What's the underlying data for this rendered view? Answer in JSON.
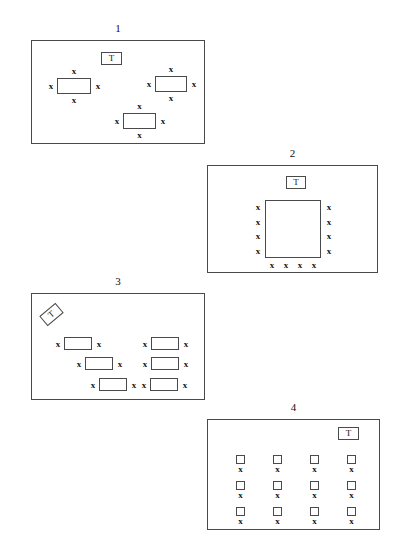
{
  "figure": {
    "background_color": "#ffffff",
    "line_color": "#4a4a4a",
    "text_color": "#111111",
    "mark_symbol": "x",
    "badge_symbol": "T",
    "width": 412,
    "height": 548
  },
  "panels": [
    {
      "label": "1",
      "x": 31,
      "y": 40,
      "w": 174,
      "h": 104,
      "badge": {
        "x": 101,
        "y": 52,
        "w": 21,
        "h": 13,
        "text": "T",
        "rotated": false
      },
      "nodes": [
        {
          "name": "node-1-left",
          "x": 57,
          "y": 78,
          "w": 34,
          "h": 16,
          "marks": [
            {
              "side": "top",
              "text": "x"
            },
            {
              "side": "left",
              "text": "x"
            },
            {
              "side": "right",
              "text": "x"
            },
            {
              "side": "bottom",
              "text": "x"
            }
          ]
        },
        {
          "name": "node-1-right",
          "x": 155,
          "y": 76,
          "w": 32,
          "h": 16,
          "marks": [
            {
              "side": "top",
              "text": "x"
            },
            {
              "side": "left",
              "text": "x"
            },
            {
              "side": "right",
              "text": "x"
            },
            {
              "side": "bottom",
              "text": "x"
            }
          ]
        },
        {
          "name": "node-1-bottom",
          "x": 123,
          "y": 113,
          "w": 33,
          "h": 16,
          "marks": [
            {
              "side": "top",
              "text": "x"
            },
            {
              "side": "left",
              "text": "x"
            },
            {
              "side": "right",
              "text": "x"
            },
            {
              "side": "bottom",
              "text": "x"
            }
          ]
        }
      ],
      "grid": null
    },
    {
      "label": "2",
      "x": 207,
      "y": 165,
      "w": 171,
      "h": 108,
      "badge": {
        "x": 286,
        "y": 176,
        "w": 20,
        "h": 13,
        "text": "T",
        "rotated": false
      },
      "nodes": [
        {
          "name": "node-2-center",
          "x": 265,
          "y": 200,
          "w": 56,
          "h": 58,
          "marks": [
            {
              "side": "left-stack",
              "text": "x",
              "count": 4
            },
            {
              "side": "right-stack",
              "text": "x",
              "count": 4
            },
            {
              "side": "bottom-row",
              "text": "x",
              "count": 4
            }
          ]
        }
      ],
      "grid": null
    },
    {
      "label": "3",
      "x": 31,
      "y": 293,
      "w": 174,
      "h": 107,
      "badge": {
        "x": 41,
        "y": 308,
        "w": 21,
        "h": 13,
        "text": "T",
        "rotated": true
      },
      "nodes": [
        {
          "name": "node-3-a",
          "x": 64,
          "y": 337,
          "w": 28,
          "h": 13,
          "marks": [
            {
              "side": "left",
              "text": "x"
            },
            {
              "side": "right",
              "text": "x"
            }
          ]
        },
        {
          "name": "node-3-b",
          "x": 151,
          "y": 337,
          "w": 28,
          "h": 13,
          "marks": [
            {
              "side": "left",
              "text": "x"
            },
            {
              "side": "right",
              "text": "x"
            }
          ]
        },
        {
          "name": "node-3-c",
          "x": 85,
          "y": 357,
          "w": 28,
          "h": 13,
          "marks": [
            {
              "side": "left",
              "text": "x"
            },
            {
              "side": "right",
              "text": "x"
            }
          ]
        },
        {
          "name": "node-3-d",
          "x": 151,
          "y": 357,
          "w": 28,
          "h": 13,
          "marks": [
            {
              "side": "left",
              "text": "x"
            },
            {
              "side": "right",
              "text": "x"
            }
          ]
        },
        {
          "name": "node-3-e",
          "x": 99,
          "y": 378,
          "w": 28,
          "h": 13,
          "marks": [
            {
              "side": "left",
              "text": "x"
            },
            {
              "side": "right",
              "text": "x"
            }
          ]
        },
        {
          "name": "node-3-f",
          "x": 150,
          "y": 378,
          "w": 28,
          "h": 13,
          "marks": [
            {
              "side": "left",
              "text": "x"
            },
            {
              "side": "right",
              "text": "x"
            }
          ]
        }
      ],
      "grid": null
    },
    {
      "label": "4",
      "x": 207,
      "y": 419,
      "w": 173,
      "h": 111,
      "badge": {
        "x": 338,
        "y": 427,
        "w": 21,
        "h": 13,
        "text": "T",
        "rotated": false
      },
      "nodes": [],
      "grid": {
        "name": "grid-4",
        "columns": 4,
        "rows": 3,
        "cell_size": 9,
        "col_x": [
          236,
          273,
          310,
          347
        ],
        "row_y": [
          455,
          481,
          507
        ],
        "mark": "x"
      }
    }
  ]
}
